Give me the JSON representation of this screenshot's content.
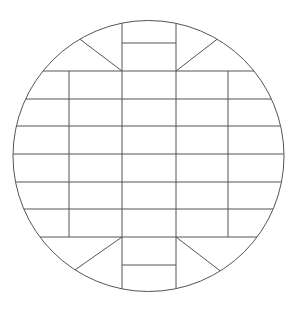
{
  "diagram": {
    "type": "wafer-die-layout",
    "stroke_color": "#555555",
    "background": "#ffffff",
    "circle": {
      "cx": 148.5,
      "cy": 156,
      "r": 135.5
    },
    "vertical_lines_x": [
      69,
      122,
      176,
      228
    ],
    "horizontal_lines_y": [
      71,
      99,
      126,
      154,
      182,
      209,
      237
    ],
    "center_column": {
      "x1": 122,
      "x2": 176,
      "top_split_y": 43,
      "bottom_split_y": 265
    },
    "diagonals": [
      {
        "x1": 122,
        "y1": 71,
        "x2": 77,
        "y2": 37
      },
      {
        "x1": 176,
        "y1": 71,
        "x2": 220,
        "y2": 37
      },
      {
        "x1": 122,
        "y1": 237,
        "x2": 72,
        "y2": 272
      },
      {
        "x1": 176,
        "y1": 237,
        "x2": 223,
        "y2": 273
      }
    ]
  }
}
